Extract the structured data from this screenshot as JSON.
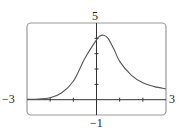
{
  "chart_data": {
    "type": "line",
    "title": "",
    "xlabel": "",
    "ylabel": "",
    "xlim": [
      -3,
      3
    ],
    "ylim": [
      -1,
      5
    ],
    "grid": false,
    "tick_labels": {
      "x_min": "−3",
      "x_max": "3",
      "y_min": "−1",
      "y_max": "5"
    },
    "x_ticks": [
      -2,
      -1,
      1,
      2
    ],
    "y_ticks": [
      1,
      2,
      3,
      4
    ],
    "series": [
      {
        "name": "f(x)",
        "x": [
          -3,
          -2.5,
          -2,
          -1.5,
          -1,
          -0.5,
          0,
          0.15,
          0.3,
          0.5,
          0.75,
          1,
          1.5,
          2,
          2.5,
          3
        ],
        "values": [
          0.02,
          0.04,
          0.12,
          0.45,
          1.2,
          2.7,
          3.9,
          4.15,
          4.2,
          4.0,
          3.3,
          2.5,
          1.6,
          1.1,
          0.85,
          0.7
        ]
      }
    ]
  },
  "labels": {
    "x_min": "−3",
    "x_max": "3",
    "y_min": "−1",
    "y_max": "5"
  }
}
